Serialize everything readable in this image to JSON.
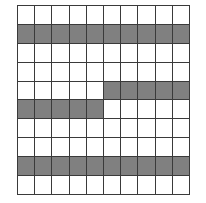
{
  "figure": {
    "type": "grid",
    "rows": 10,
    "columns": 10,
    "colors": {
      "filled": "#808080",
      "empty": "#ffffff",
      "gridline": "#3a3a3a",
      "background": "#ffffff"
    },
    "legend": {
      "filled_label": "shaded",
      "empty_label": "unshaded"
    }
  },
  "chart_data": {
    "type": "heatmap",
    "title": "",
    "xlabel": "",
    "ylabel": "",
    "categories_x": [
      "1",
      "2",
      "3",
      "4",
      "5",
      "6",
      "7",
      "8",
      "9",
      "10"
    ],
    "categories_y": [
      "1",
      "2",
      "3",
      "4",
      "5",
      "6",
      "7",
      "8",
      "9",
      "10"
    ],
    "grid": true,
    "legend_position": "none",
    "value_map": {
      "0": "unshaded",
      "1": "shaded"
    },
    "filled_count": 30,
    "empty_count": 70,
    "matrix": [
      [
        0,
        0,
        0,
        0,
        0,
        0,
        0,
        0,
        0,
        0
      ],
      [
        1,
        1,
        1,
        1,
        1,
        1,
        1,
        1,
        1,
        1
      ],
      [
        0,
        0,
        0,
        0,
        0,
        0,
        0,
        0,
        0,
        0
      ],
      [
        0,
        0,
        0,
        0,
        0,
        0,
        0,
        0,
        0,
        0
      ],
      [
        0,
        0,
        0,
        0,
        0,
        1,
        1,
        1,
        1,
        1
      ],
      [
        1,
        1,
        1,
        1,
        1,
        0,
        0,
        0,
        0,
        0
      ],
      [
        0,
        0,
        0,
        0,
        0,
        0,
        0,
        0,
        0,
        0
      ],
      [
        0,
        0,
        0,
        0,
        0,
        0,
        0,
        0,
        0,
        0
      ],
      [
        1,
        1,
        1,
        1,
        1,
        1,
        1,
        1,
        1,
        1
      ],
      [
        0,
        0,
        0,
        0,
        0,
        0,
        0,
        0,
        0,
        0
      ]
    ],
    "row_filled_counts": [
      0,
      10,
      0,
      0,
      5,
      5,
      0,
      0,
      10,
      0
    ]
  }
}
